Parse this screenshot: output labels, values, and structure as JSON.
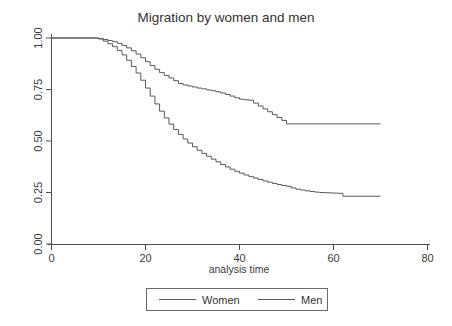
{
  "chart_data": {
    "type": "line",
    "subtype": "kaplan-meier-step",
    "title": "Migration by women and men",
    "xlabel": "analysis time",
    "ylabel": "",
    "xlim": [
      0,
      80
    ],
    "ylim": [
      0,
      1.0
    ],
    "xticks": [
      0,
      20,
      40,
      60,
      80
    ],
    "xtick_labels": [
      "0",
      "20",
      "40",
      "60",
      "80"
    ],
    "yticks": [
      0.0,
      0.25,
      0.5,
      0.75,
      1.0
    ],
    "ytick_labels": [
      "0.00",
      "0.25",
      "0.50",
      "0.75",
      "1.00"
    ],
    "grid": false,
    "legend_position": "below-center",
    "series": [
      {
        "name": "Women",
        "color": "#595959",
        "x": [
          0,
          8,
          10,
          11,
          12,
          13,
          14,
          15,
          16,
          17,
          18,
          19,
          20,
          21,
          22,
          23,
          24,
          25,
          26,
          27,
          28,
          29,
          30,
          31,
          32,
          33,
          34,
          35,
          36,
          37,
          38,
          39,
          40,
          41,
          42,
          43,
          44,
          45,
          46,
          47,
          48,
          49,
          50,
          51,
          52,
          53,
          54,
          55,
          56,
          57,
          58,
          59,
          60,
          61,
          62,
          70
        ],
        "y": [
          1.0,
          1.0,
          0.995,
          0.985,
          0.972,
          0.958,
          0.94,
          0.918,
          0.892,
          0.862,
          0.83,
          0.795,
          0.757,
          0.718,
          0.68,
          0.645,
          0.612,
          0.582,
          0.556,
          0.532,
          0.51,
          0.49,
          0.472,
          0.455,
          0.44,
          0.426,
          0.412,
          0.399,
          0.386,
          0.374,
          0.363,
          0.353,
          0.344,
          0.335,
          0.327,
          0.32,
          0.313,
          0.306,
          0.3,
          0.294,
          0.289,
          0.284,
          0.28,
          0.272,
          0.266,
          0.262,
          0.258,
          0.255,
          0.252,
          0.25,
          0.249,
          0.248,
          0.247,
          0.246,
          0.232,
          0.232
        ]
      },
      {
        "name": "Men",
        "color": "#595959",
        "x": [
          0,
          8,
          10,
          11,
          12,
          13,
          14,
          15,
          16,
          17,
          18,
          19,
          20,
          21,
          22,
          23,
          24,
          25,
          26,
          27,
          28,
          29,
          30,
          31,
          32,
          33,
          34,
          35,
          36,
          37,
          38,
          39,
          40,
          41,
          42,
          43,
          44,
          45,
          46,
          47,
          48,
          49,
          50,
          70
        ],
        "y": [
          1.0,
          1.0,
          0.998,
          0.993,
          0.988,
          0.982,
          0.974,
          0.964,
          0.952,
          0.938,
          0.922,
          0.904,
          0.885,
          0.866,
          0.848,
          0.832,
          0.818,
          0.806,
          0.793,
          0.779,
          0.772,
          0.767,
          0.762,
          0.757,
          0.753,
          0.748,
          0.744,
          0.739,
          0.733,
          0.726,
          0.718,
          0.71,
          0.703,
          0.7,
          0.698,
          0.684,
          0.67,
          0.656,
          0.642,
          0.628,
          0.614,
          0.6,
          0.583,
          0.583
        ]
      }
    ],
    "annotations": {
      "women_plateau_value": 0.23,
      "women_plateau_start": 62,
      "men_plateau_value": 0.58,
      "men_plateau_start": 50
    }
  },
  "legend": {
    "items": [
      {
        "label": "Women"
      },
      {
        "label": "Men"
      }
    ]
  }
}
